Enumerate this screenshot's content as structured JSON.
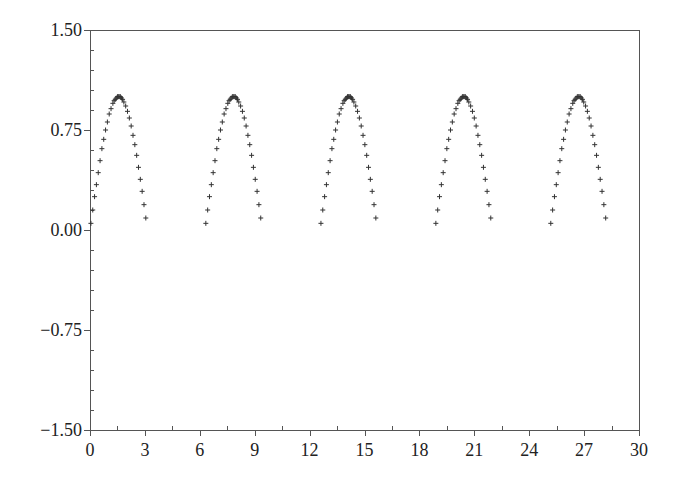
{
  "chart_data": {
    "type": "scatter",
    "title": "",
    "xlabel": "",
    "ylabel": "",
    "xlim": [
      0,
      30
    ],
    "ylim": [
      -1.5,
      1.5
    ],
    "grid": false,
    "legend": null,
    "marker": "+",
    "marker_color": "#333333",
    "x_ticks": [
      0,
      3,
      6,
      9,
      12,
      15,
      18,
      21,
      24,
      27,
      30
    ],
    "x_tick_labels": [
      "0",
      "3",
      "6",
      "9",
      "12",
      "15",
      "18",
      "21",
      "24",
      "27",
      "30"
    ],
    "x_minor_step": 1.5,
    "y_ticks": [
      1.5,
      0.75,
      0.0,
      -0.75,
      -1.5
    ],
    "y_tick_labels": [
      "1.50",
      "0.75",
      "0.00",
      "−0.75",
      "−1.50"
    ],
    "y_minor_step": 0.15,
    "series": [
      {
        "name": "sin(x) positive half-waves",
        "points": [
          [
            0.05,
            0.05
          ],
          [
            0.15,
            0.15
          ],
          [
            0.25,
            0.25
          ],
          [
            0.35,
            0.34
          ],
          [
            0.45,
            0.43
          ],
          [
            0.55,
            0.52
          ],
          [
            0.65,
            0.61
          ],
          [
            0.75,
            0.68
          ],
          [
            0.85,
            0.75
          ],
          [
            0.95,
            0.81
          ],
          [
            1.05,
            0.87
          ],
          [
            1.15,
            0.91
          ],
          [
            1.25,
            0.95
          ],
          [
            1.32,
            0.97
          ],
          [
            1.38,
            0.98
          ],
          [
            1.44,
            0.99
          ],
          [
            1.5,
            1.0
          ],
          [
            1.55,
            1.0
          ],
          [
            1.6,
            1.0
          ],
          [
            1.66,
            1.0
          ],
          [
            1.72,
            0.99
          ],
          [
            1.78,
            0.98
          ],
          [
            1.85,
            0.96
          ],
          [
            1.95,
            0.93
          ],
          [
            2.05,
            0.89
          ],
          [
            2.15,
            0.84
          ],
          [
            2.25,
            0.78
          ],
          [
            2.35,
            0.71
          ],
          [
            2.45,
            0.64
          ],
          [
            2.55,
            0.56
          ],
          [
            2.65,
            0.47
          ],
          [
            2.75,
            0.38
          ],
          [
            2.85,
            0.29
          ],
          [
            2.95,
            0.19
          ],
          [
            3.05,
            0.09
          ],
          [
            6.33,
            0.05
          ],
          [
            6.43,
            0.15
          ],
          [
            6.53,
            0.25
          ],
          [
            6.63,
            0.34
          ],
          [
            6.73,
            0.43
          ],
          [
            6.83,
            0.52
          ],
          [
            6.93,
            0.61
          ],
          [
            7.03,
            0.68
          ],
          [
            7.13,
            0.75
          ],
          [
            7.23,
            0.81
          ],
          [
            7.33,
            0.87
          ],
          [
            7.43,
            0.91
          ],
          [
            7.53,
            0.95
          ],
          [
            7.6,
            0.97
          ],
          [
            7.66,
            0.98
          ],
          [
            7.72,
            0.99
          ],
          [
            7.78,
            1.0
          ],
          [
            7.83,
            1.0
          ],
          [
            7.88,
            1.0
          ],
          [
            7.94,
            1.0
          ],
          [
            8.0,
            0.99
          ],
          [
            8.06,
            0.98
          ],
          [
            8.13,
            0.96
          ],
          [
            8.23,
            0.93
          ],
          [
            8.33,
            0.89
          ],
          [
            8.43,
            0.84
          ],
          [
            8.53,
            0.78
          ],
          [
            8.63,
            0.71
          ],
          [
            8.73,
            0.64
          ],
          [
            8.83,
            0.56
          ],
          [
            8.93,
            0.47
          ],
          [
            9.03,
            0.38
          ],
          [
            9.13,
            0.29
          ],
          [
            9.23,
            0.19
          ],
          [
            9.33,
            0.09
          ],
          [
            12.62,
            0.05
          ],
          [
            12.72,
            0.15
          ],
          [
            12.82,
            0.25
          ],
          [
            12.92,
            0.34
          ],
          [
            13.02,
            0.43
          ],
          [
            13.12,
            0.52
          ],
          [
            13.22,
            0.61
          ],
          [
            13.32,
            0.68
          ],
          [
            13.42,
            0.75
          ],
          [
            13.52,
            0.81
          ],
          [
            13.62,
            0.87
          ],
          [
            13.72,
            0.91
          ],
          [
            13.82,
            0.95
          ],
          [
            13.89,
            0.97
          ],
          [
            13.95,
            0.98
          ],
          [
            14.01,
            0.99
          ],
          [
            14.07,
            1.0
          ],
          [
            14.12,
            1.0
          ],
          [
            14.17,
            1.0
          ],
          [
            14.23,
            1.0
          ],
          [
            14.29,
            0.99
          ],
          [
            14.35,
            0.98
          ],
          [
            14.42,
            0.96
          ],
          [
            14.52,
            0.93
          ],
          [
            14.62,
            0.89
          ],
          [
            14.72,
            0.84
          ],
          [
            14.82,
            0.78
          ],
          [
            14.92,
            0.71
          ],
          [
            15.02,
            0.64
          ],
          [
            15.12,
            0.56
          ],
          [
            15.22,
            0.47
          ],
          [
            15.32,
            0.38
          ],
          [
            15.42,
            0.29
          ],
          [
            15.52,
            0.19
          ],
          [
            15.62,
            0.09
          ],
          [
            18.9,
            0.05
          ],
          [
            19.0,
            0.15
          ],
          [
            19.1,
            0.25
          ],
          [
            19.2,
            0.34
          ],
          [
            19.3,
            0.43
          ],
          [
            19.4,
            0.52
          ],
          [
            19.5,
            0.61
          ],
          [
            19.6,
            0.68
          ],
          [
            19.7,
            0.75
          ],
          [
            19.8,
            0.81
          ],
          [
            19.9,
            0.87
          ],
          [
            20.0,
            0.91
          ],
          [
            20.1,
            0.95
          ],
          [
            20.17,
            0.97
          ],
          [
            20.23,
            0.98
          ],
          [
            20.29,
            0.99
          ],
          [
            20.35,
            1.0
          ],
          [
            20.4,
            1.0
          ],
          [
            20.45,
            1.0
          ],
          [
            20.51,
            1.0
          ],
          [
            20.57,
            0.99
          ],
          [
            20.63,
            0.98
          ],
          [
            20.7,
            0.96
          ],
          [
            20.8,
            0.93
          ],
          [
            20.9,
            0.89
          ],
          [
            21.0,
            0.84
          ],
          [
            21.1,
            0.78
          ],
          [
            21.2,
            0.71
          ],
          [
            21.3,
            0.64
          ],
          [
            21.4,
            0.56
          ],
          [
            21.5,
            0.47
          ],
          [
            21.6,
            0.38
          ],
          [
            21.7,
            0.29
          ],
          [
            21.8,
            0.19
          ],
          [
            21.9,
            0.09
          ],
          [
            25.18,
            0.05
          ],
          [
            25.28,
            0.15
          ],
          [
            25.38,
            0.25
          ],
          [
            25.48,
            0.34
          ],
          [
            25.58,
            0.43
          ],
          [
            25.68,
            0.52
          ],
          [
            25.78,
            0.61
          ],
          [
            25.88,
            0.68
          ],
          [
            25.98,
            0.75
          ],
          [
            26.08,
            0.81
          ],
          [
            26.18,
            0.87
          ],
          [
            26.28,
            0.91
          ],
          [
            26.38,
            0.95
          ],
          [
            26.45,
            0.97
          ],
          [
            26.51,
            0.98
          ],
          [
            26.57,
            0.99
          ],
          [
            26.63,
            1.0
          ],
          [
            26.68,
            1.0
          ],
          [
            26.73,
            1.0
          ],
          [
            26.79,
            1.0
          ],
          [
            26.85,
            0.99
          ],
          [
            26.91,
            0.98
          ],
          [
            26.98,
            0.96
          ],
          [
            27.08,
            0.93
          ],
          [
            27.18,
            0.89
          ],
          [
            27.28,
            0.84
          ],
          [
            27.38,
            0.78
          ],
          [
            27.48,
            0.71
          ],
          [
            27.58,
            0.64
          ],
          [
            27.68,
            0.56
          ],
          [
            27.78,
            0.47
          ],
          [
            27.88,
            0.38
          ],
          [
            27.98,
            0.29
          ],
          [
            28.08,
            0.19
          ],
          [
            28.18,
            0.09
          ]
        ]
      }
    ]
  },
  "layout": {
    "plot_left": 90,
    "plot_right": 639,
    "plot_top": 30,
    "plot_bottom": 430
  }
}
